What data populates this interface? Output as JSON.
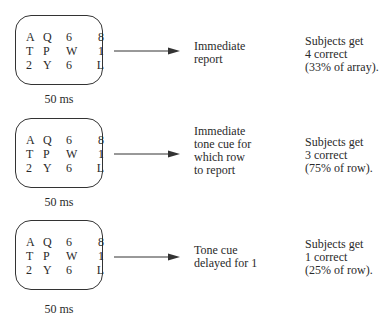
{
  "panels": [
    {
      "array": [
        [
          "A",
          "Q",
          "6",
          "8"
        ],
        [
          "T",
          "P",
          "W",
          "1"
        ],
        [
          "2",
          "Y",
          "6",
          "L"
        ]
      ],
      "duration": "50 ms",
      "condition": [
        "Immediate",
        "report"
      ],
      "result": [
        "Subjects get",
        "4 correct",
        "(33% of array)."
      ]
    },
    {
      "array": [
        [
          "A",
          "Q",
          "6",
          "8"
        ],
        [
          "T",
          "P",
          "W",
          "1"
        ],
        [
          "2",
          "Y",
          "6",
          "L"
        ]
      ],
      "duration": "50 ms",
      "condition": [
        "Immediate",
        "tone cue for",
        "which row",
        "to report"
      ],
      "result": [
        "Subjects get",
        "3 correct",
        "(75% of row)."
      ]
    },
    {
      "array": [
        [
          "A",
          "Q",
          "6",
          "8"
        ],
        [
          "T",
          "P",
          "W",
          "1"
        ],
        [
          "2",
          "Y",
          "6",
          "L"
        ]
      ],
      "duration": "50 ms",
      "condition": [
        "Tone cue",
        "delayed for 1"
      ],
      "result": [
        "Subjects get",
        "1 correct",
        "(25% of row)."
      ]
    }
  ],
  "colors": {
    "stroke": "#333333",
    "text": "#2a2a2a"
  }
}
